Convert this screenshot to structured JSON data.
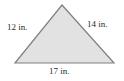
{
  "figure": {
    "type": "triangle-diagram",
    "background_color": "#ffffff",
    "shape": {
      "name": "triangle",
      "fill_color": "#e2e2e2",
      "stroke_color": "#808080",
      "stroke_width": 1.2,
      "vertices": [
        {
          "name": "apex",
          "x": 62,
          "y": 5
        },
        {
          "name": "bottom-right",
          "x": 114,
          "y": 63
        },
        {
          "name": "bottom-left",
          "x": 15,
          "y": 63
        }
      ]
    },
    "labels": {
      "left_side": "12 in.",
      "right_side": "14 in.",
      "bottom_side": "17 in."
    },
    "measurements": {
      "unit": "in.",
      "sides": [
        {
          "position": "left",
          "value": 12,
          "text": "12 in."
        },
        {
          "position": "right",
          "value": 14,
          "text": "14 in."
        },
        {
          "position": "bottom",
          "value": 17,
          "text": "17 in."
        }
      ]
    }
  }
}
